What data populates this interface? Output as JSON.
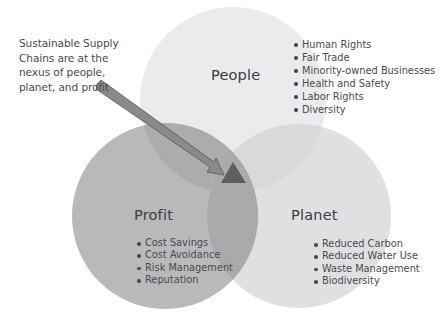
{
  "callout": {
    "lines": [
      "Sustainable Supply",
      "Chains are at the",
      "nexus of people,",
      "planet, and profit"
    ]
  },
  "circles": {
    "people": {
      "title": "People",
      "items": [
        "Human Rights",
        "Fair Trade",
        "Minority-owned Businesses",
        "Health and Safety",
        "Labor Rights",
        "Diversity"
      ],
      "color": "#ebebed"
    },
    "profit": {
      "title": "Profit",
      "items": [
        "Cost Savings",
        "Cost Avoidance",
        "Risk Management",
        "Reputation"
      ],
      "color": "#b9b9bb"
    },
    "planet": {
      "title": "Planet",
      "items": [
        "Reduced Carbon",
        "Reduced Water Use",
        "Waste Management",
        "Biodiversity"
      ],
      "color": "#e0e0e2"
    }
  },
  "center_marker": {
    "shape": "triangle",
    "color": "#5e5e5e"
  },
  "arrow": {
    "color": "#8a8a8c",
    "outline": "#555557"
  }
}
